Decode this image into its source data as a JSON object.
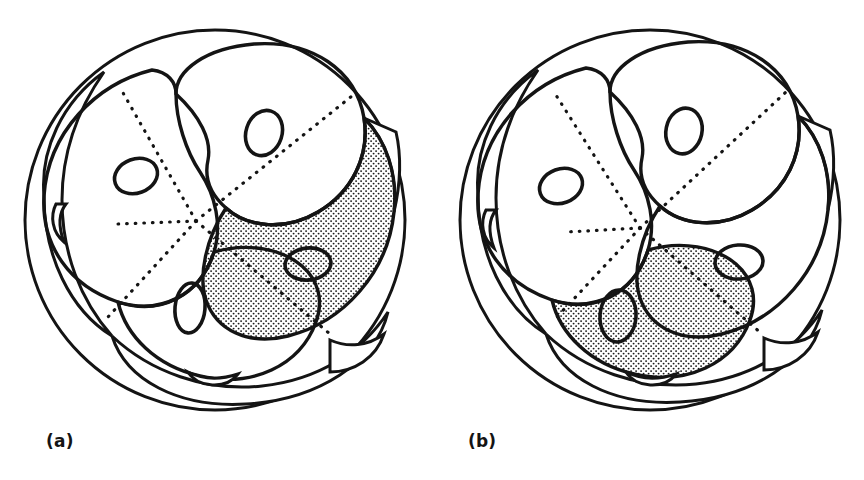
{
  "figure": {
    "kind": "line-drawing",
    "background_color": "#ffffff",
    "ink_color": "#141414",
    "stipple_color": "#1a1a1a",
    "panels": [
      {
        "id": "a",
        "label": "(a)",
        "label_x": 46,
        "label_y": 447,
        "center_x": 215,
        "center_y": 220,
        "outer_radius": 190,
        "shaded_cell": "right",
        "shaded_cell_index": 3,
        "upper_cells": [
          {
            "name": "upper-left-cell",
            "shaded": false,
            "nucleus": {
              "cx": 136,
              "cy": 176,
              "rx": 22,
              "ry": 17,
              "rotate": -20
            }
          },
          {
            "name": "upper-top-cell",
            "shaded": false,
            "nucleus": {
              "cx": 264,
              "cy": 133,
              "rx": 18,
              "ry": 23,
              "rotate": 18
            }
          },
          {
            "name": "lower-left-cell",
            "shaded": false,
            "nucleus": {
              "cx": 190,
              "cy": 308,
              "rx": 15,
              "ry": 25,
              "rotate": 5
            }
          },
          {
            "name": "right-cell",
            "shaded": true,
            "nucleus": {
              "cx": 308,
              "cy": 264,
              "rx": 23,
              "ry": 16,
              "rotate": -6
            }
          }
        ],
        "hidden_nucleus_crescents": [
          {
            "name": "left-edge-crescent",
            "cx": 62,
            "cy": 222
          },
          {
            "name": "bottom-crescent",
            "cx": 212,
            "cy": 385
          }
        ]
      },
      {
        "id": "b",
        "label": "(b)",
        "label_x": 468,
        "label_y": 447,
        "center_x": 650,
        "center_y": 220,
        "outer_radius": 190,
        "shaded_cell": "bottom-left",
        "shaded_cell_index": 2,
        "upper_cells": [
          {
            "name": "upper-left-cell",
            "shaded": false,
            "nucleus": {
              "cx": 561,
              "cy": 186,
              "rx": 22,
              "ry": 17,
              "rotate": -20
            }
          },
          {
            "name": "upper-top-cell",
            "shaded": false,
            "nucleus": {
              "cx": 684,
              "cy": 131,
              "rx": 18,
              "ry": 23,
              "rotate": 12
            }
          },
          {
            "name": "lower-left-cell",
            "shaded": true,
            "nucleus": {
              "cx": 618,
              "cy": 316,
              "rx": 18,
              "ry": 26,
              "rotate": 4
            }
          },
          {
            "name": "right-cell",
            "shaded": false,
            "nucleus": {
              "cx": 739,
              "cy": 262,
              "rx": 24,
              "ry": 17,
              "rotate": -4
            }
          }
        ],
        "hidden_nucleus_crescents": [
          {
            "name": "left-edge-crescent",
            "cx": 492,
            "cy": 228
          },
          {
            "name": "bottom-crescent",
            "cx": 650,
            "cy": 390
          }
        ]
      }
    ]
  }
}
